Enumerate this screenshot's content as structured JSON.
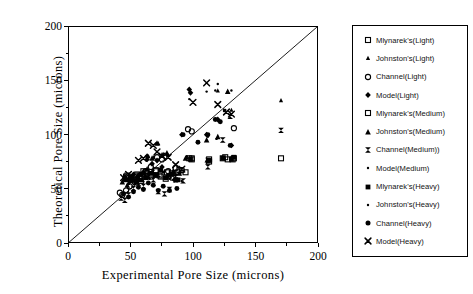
{
  "chart_data": {
    "type": "scatter",
    "title": "",
    "xlabel": "Experimental Pore Size (microns)",
    "ylabel": "Theoretical Pore Size (microns)",
    "xlim": [
      0,
      200
    ],
    "ylim": [
      0,
      200
    ],
    "xticks": [
      0,
      50,
      100,
      150,
      200
    ],
    "yticks": [
      0,
      50,
      100,
      150,
      200
    ],
    "xtick_labels": [
      "0",
      "50",
      "100",
      "150",
      "200"
    ],
    "ytick_labels": [
      "0",
      "50",
      "100",
      "150",
      "200"
    ],
    "minor_ticks": true,
    "grid": false,
    "legend_position": "right-outside",
    "reference_line": {
      "name": "y = x parity line",
      "from": [
        0,
        0
      ],
      "to": [
        200,
        200
      ],
      "style": "solid",
      "color": "#000000"
    },
    "series": [
      {
        "name": "Mlynarek's(Light)",
        "marker": "open-square",
        "color": "#000000",
        "points": [
          [
            47,
            62
          ],
          [
            50,
            60
          ],
          [
            52,
            58
          ],
          [
            55,
            63
          ],
          [
            57,
            59
          ],
          [
            60,
            66
          ],
          [
            63,
            64
          ],
          [
            66,
            61
          ],
          [
            70,
            67
          ],
          [
            73,
            62
          ],
          [
            78,
            59
          ],
          [
            83,
            64
          ],
          [
            88,
            65
          ],
          [
            97,
            78
          ],
          [
            99,
            77
          ],
          [
            113,
            75
          ],
          [
            124,
            78
          ],
          [
            128,
            77
          ],
          [
            133,
            78
          ],
          [
            171,
            78
          ]
        ]
      },
      {
        "name": "Johnston's(Light)",
        "marker": "small-triangle",
        "color": "#000000",
        "points": [
          [
            44,
            58
          ],
          [
            48,
            55
          ],
          [
            51,
            61
          ],
          [
            54,
            57
          ],
          [
            58,
            64
          ],
          [
            61,
            62
          ],
          [
            64,
            80
          ],
          [
            68,
            79
          ],
          [
            72,
            92
          ],
          [
            76,
            82
          ],
          [
            80,
            81
          ],
          [
            95,
            79
          ],
          [
            111,
            76
          ],
          [
            120,
            141
          ],
          [
            128,
            140
          ],
          [
            131,
            123
          ],
          [
            171,
            132
          ]
        ]
      },
      {
        "name": "Channel(Light)",
        "marker": "open-circle",
        "color": "#000000",
        "points": [
          [
            41,
            46
          ],
          [
            43,
            44
          ],
          [
            46,
            48
          ],
          [
            49,
            52
          ],
          [
            53,
            56
          ],
          [
            57,
            60
          ],
          [
            62,
            66
          ],
          [
            66,
            70
          ],
          [
            71,
            79
          ],
          [
            75,
            77
          ],
          [
            80,
            66
          ],
          [
            86,
            69
          ],
          [
            91,
            67
          ],
          [
            96,
            105
          ],
          [
            99,
            103
          ],
          [
            133,
            106
          ]
        ]
      },
      {
        "name": "Model(Light)",
        "marker": "filled-diamond",
        "color": "#000000",
        "points": [
          [
            45,
            60
          ],
          [
            49,
            57
          ],
          [
            52,
            63
          ],
          [
            56,
            59
          ],
          [
            60,
            65
          ],
          [
            63,
            77
          ],
          [
            63,
            80
          ],
          [
            67,
            73
          ],
          [
            71,
            76
          ],
          [
            75,
            70
          ],
          [
            80,
            62
          ],
          [
            85,
            58
          ],
          [
            91,
            100
          ],
          [
            97,
            142
          ],
          [
            98,
            139
          ],
          [
            111,
            100
          ],
          [
            120,
            114
          ],
          [
            131,
            90
          ]
        ]
      },
      {
        "name": "Mlynarek's(Medium)",
        "marker": "open-square",
        "color": "#000000",
        "points": [
          [
            46,
            61
          ],
          [
            50,
            59
          ],
          [
            54,
            62
          ],
          [
            58,
            57
          ],
          [
            62,
            65
          ],
          [
            66,
            63
          ],
          [
            70,
            66
          ],
          [
            74,
            61
          ],
          [
            79,
            65
          ],
          [
            84,
            60
          ],
          [
            89,
            67
          ],
          [
            94,
            65
          ],
          [
            99,
            78
          ],
          [
            113,
            77
          ],
          [
            126,
            79
          ],
          [
            132,
            77
          ]
        ]
      },
      {
        "name": "Johnston's(Medium)",
        "marker": "filled-triangle",
        "color": "#000000",
        "points": [
          [
            43,
            56
          ],
          [
            47,
            53
          ],
          [
            51,
            59
          ],
          [
            55,
            62
          ],
          [
            59,
            58
          ],
          [
            63,
            68
          ],
          [
            67,
            78
          ],
          [
            71,
            92
          ],
          [
            75,
            81
          ],
          [
            79,
            83
          ],
          [
            84,
            66
          ],
          [
            89,
            64
          ],
          [
            94,
            78
          ],
          [
            111,
            95
          ],
          [
            120,
            98
          ],
          [
            128,
            140
          ]
        ]
      },
      {
        "name": "Channel(Medium))",
        "marker": "bowtie",
        "color": "#000000",
        "points": [
          [
            42,
            41
          ],
          [
            45,
            39
          ],
          [
            48,
            44
          ],
          [
            52,
            50
          ],
          [
            56,
            55
          ],
          [
            60,
            52
          ],
          [
            64,
            62
          ],
          [
            68,
            58
          ],
          [
            72,
            47
          ],
          [
            77,
            45
          ],
          [
            81,
            49
          ],
          [
            86,
            58
          ],
          [
            92,
            57
          ],
          [
            112,
            70
          ],
          [
            112,
            76
          ],
          [
            124,
            95
          ],
          [
            130,
            117
          ],
          [
            171,
            104
          ]
        ]
      },
      {
        "name": "Model(Medium)",
        "marker": "dot",
        "color": "#000000",
        "points": [
          [
            44,
            59
          ],
          [
            48,
            62
          ],
          [
            52,
            57
          ],
          [
            56,
            61
          ],
          [
            60,
            64
          ],
          [
            64,
            60
          ],
          [
            68,
            67
          ],
          [
            72,
            63
          ],
          [
            76,
            65
          ],
          [
            81,
            59
          ],
          [
            86,
            62
          ],
          [
            91,
            57
          ],
          [
            97,
            133
          ],
          [
            111,
            140
          ],
          [
            118,
            141
          ],
          [
            120,
            147
          ],
          [
            125,
            122
          ]
        ]
      },
      {
        "name": "Mlynarek's(Heavy)",
        "marker": "filled-square",
        "color": "#000000",
        "points": [
          [
            46,
            58
          ],
          [
            50,
            61
          ],
          [
            54,
            56
          ],
          [
            58,
            63
          ],
          [
            62,
            60
          ],
          [
            66,
            64
          ],
          [
            70,
            62
          ],
          [
            74,
            67
          ],
          [
            78,
            60
          ],
          [
            83,
            63
          ],
          [
            88,
            58
          ],
          [
            98,
            77
          ],
          [
            113,
            76
          ],
          [
            124,
            78
          ],
          [
            131,
            77
          ],
          [
            133,
            79
          ]
        ]
      },
      {
        "name": "Johnston's(Heavy)",
        "marker": "dot",
        "color": "#000000",
        "points": [
          [
            45,
            57
          ],
          [
            49,
            60
          ],
          [
            53,
            54
          ],
          [
            57,
            58
          ],
          [
            61,
            63
          ],
          [
            65,
            59
          ],
          [
            69,
            64
          ],
          [
            73,
            61
          ],
          [
            77,
            66
          ],
          [
            82,
            60
          ],
          [
            87,
            63
          ],
          [
            95,
            80
          ],
          [
            112,
            98
          ],
          [
            119,
            96
          ],
          [
            126,
            123
          ],
          [
            131,
            141
          ]
        ]
      },
      {
        "name": "Channel(Heavy)",
        "marker": "filled-circle",
        "color": "#000000",
        "points": [
          [
            44,
            45
          ],
          [
            48,
            42
          ],
          [
            52,
            47
          ],
          [
            56,
            51
          ],
          [
            60,
            49
          ],
          [
            64,
            55
          ],
          [
            68,
            53
          ],
          [
            72,
            48
          ],
          [
            76,
            52
          ],
          [
            81,
            48
          ],
          [
            87,
            50
          ],
          [
            92,
            100
          ],
          [
            104,
            93
          ],
          [
            112,
            100
          ],
          [
            118,
            114
          ],
          [
            122,
            112
          ],
          [
            130,
            90
          ]
        ]
      },
      {
        "name": "Model(Heavy)",
        "marker": "x-cross",
        "color": "#000000",
        "points": [
          [
            44,
            60
          ],
          [
            48,
            63
          ],
          [
            52,
            58
          ],
          [
            56,
            76
          ],
          [
            60,
            78
          ],
          [
            64,
            92
          ],
          [
            68,
            90
          ],
          [
            71,
            84
          ],
          [
            75,
            80
          ],
          [
            80,
            79
          ],
          [
            86,
            72
          ],
          [
            91,
            68
          ],
          [
            100,
            130
          ],
          [
            111,
            148
          ],
          [
            120,
            128
          ],
          [
            127,
            121
          ],
          [
            131,
            119
          ]
        ]
      }
    ]
  },
  "axes": {
    "y_title": "Theoretical Pore Size (microns)",
    "x_title": "Experimental Pore Size (microns)",
    "y_labels": [
      "200",
      "150",
      "100",
      "50",
      "0"
    ],
    "x_labels": [
      "0",
      "50",
      "100",
      "150",
      "200"
    ]
  },
  "legend": {
    "items": [
      {
        "label": "Mlynarek's(Light)",
        "marker": "open-square"
      },
      {
        "label": "Johnston's(Light)",
        "marker": "small-triangle"
      },
      {
        "label": "Channel(Light)",
        "marker": "open-circle"
      },
      {
        "label": "Model(Light)",
        "marker": "filled-diamond"
      },
      {
        "label": "Mlynarek's(Medium)",
        "marker": "open-square"
      },
      {
        "label": "Johnston's(Medium)",
        "marker": "filled-triangle"
      },
      {
        "label": "Channel(Medium))",
        "marker": "bowtie"
      },
      {
        "label": "Model(Medium)",
        "marker": "dot"
      },
      {
        "label": "Mlynarek's(Heavy)",
        "marker": "filled-square"
      },
      {
        "label": "Johnston's(Heavy)",
        "marker": "dot"
      },
      {
        "label": "Channel(Heavy)",
        "marker": "filled-circle"
      },
      {
        "label": "Model(Heavy)",
        "marker": "x-cross"
      }
    ]
  },
  "colors": {
    "ink": "#000000",
    "background": "#ffffff"
  }
}
